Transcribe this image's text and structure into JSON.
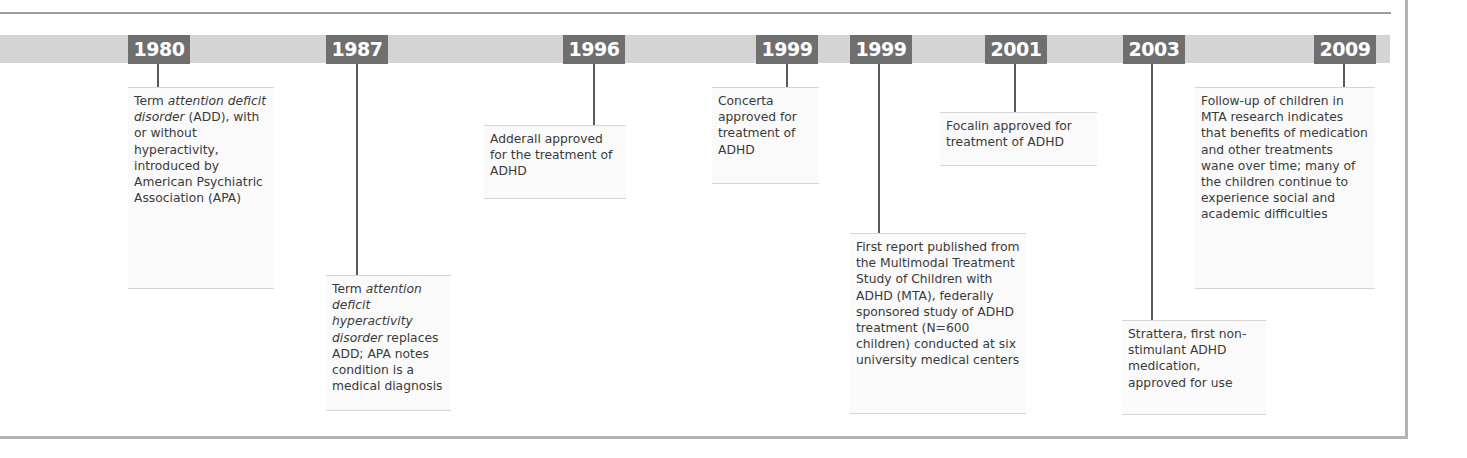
{
  "timeline": {
    "colors": {
      "band": "#d4d4d4",
      "year_label_bg": "#6f6f6f",
      "year_label_text": "#ffffff",
      "stem": "#5a5a5a",
      "frame": "#b3b3b3"
    },
    "events": [
      {
        "year": "1980",
        "text_parts": [
          "Term ",
          "attention deficit disorder",
          " (ADD), with or without hyperactivity, introduced by American Psychiatric Association (APA)"
        ]
      },
      {
        "year": "1987",
        "text_parts": [
          "Term ",
          "attention deficit hyperactivity disorder",
          " replaces ADD; APA notes condition is a medical diagnosis"
        ]
      },
      {
        "year": "1996",
        "text": "Adderall approved for the treatment of ADHD"
      },
      {
        "year": "1999",
        "text": "Concerta approved for treatment of ADHD"
      },
      {
        "year": "1999",
        "text": "First report published from the Multimodal Treatment Study of Children with ADHD (MTA), federally sponsored study of ADHD treatment (N=600 children) conducted at six university medical centers"
      },
      {
        "year": "2001",
        "text": "Focalin approved for treatment of ADHD"
      },
      {
        "year": "2003",
        "text": "Strattera, first non-stimulant ADHD medication, approved for use"
      },
      {
        "year": "2009",
        "text": "Follow-up of children in MTA research indicates that benefits of medication and other treatments wane over time; many of the children continue to experience social and academic difficulties"
      }
    ]
  }
}
